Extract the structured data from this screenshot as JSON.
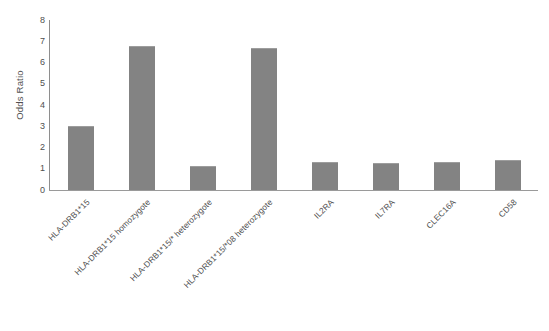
{
  "chart_data": {
    "type": "bar",
    "title": "",
    "subtitle": "",
    "xlabel": "",
    "ylabel": "Odds Ratio",
    "ylim": [
      0,
      8
    ],
    "yticks": [
      0,
      1,
      2,
      3,
      4,
      5,
      6,
      7,
      8
    ],
    "ytick_labels": [
      "0",
      "1",
      "2",
      "3",
      "4",
      "5",
      "6",
      "7",
      "8"
    ],
    "grid": false,
    "legend": null,
    "bar_color": "#838383",
    "categories": [
      "HLA-DRB1*15",
      "HLA-DRB1*15 homozygote",
      "HLA-DRB1*15/* heterozygote",
      "HLA-DRB1*15/*08 heterozygote",
      "IL2RA",
      "IL7RA",
      "CLEC16A",
      "CD58"
    ],
    "values": [
      3.0,
      6.8,
      1.15,
      6.7,
      1.3,
      1.28,
      1.3,
      1.42
    ],
    "series": [
      {
        "name": "Odds Ratio",
        "values": [
          3.0,
          6.8,
          1.15,
          6.7,
          1.3,
          1.28,
          1.3,
          1.42
        ]
      }
    ],
    "axis_color": "#9a9a9a"
  }
}
